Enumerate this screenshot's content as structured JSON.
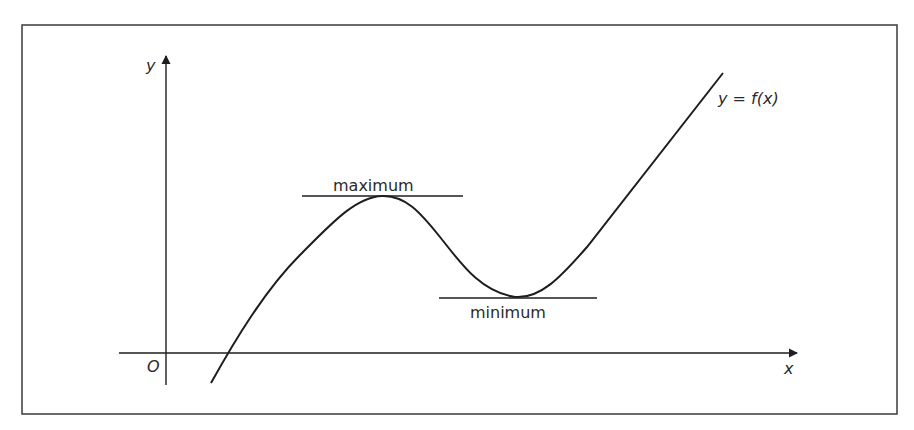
{
  "figure": {
    "type": "function-graph",
    "colors": {
      "stroke": "#1e1e1e",
      "background": "#ffffff",
      "frame": "#3a3a3a"
    }
  },
  "axes": {
    "x_label": "x",
    "y_label": "y",
    "origin_label": "O"
  },
  "curve": {
    "label": "y = f(x)"
  },
  "annotations": {
    "maximum_label": "maximum",
    "minimum_label": "minimum"
  }
}
